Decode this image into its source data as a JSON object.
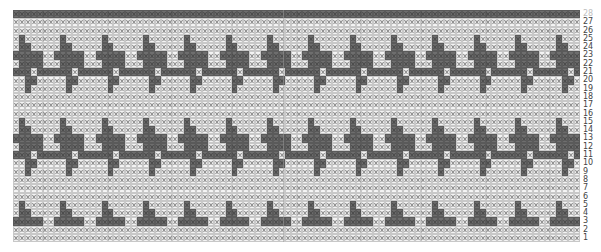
{
  "chart_title": "",
  "grid": {
    "columns": 96,
    "rows": 28,
    "cell_width_px": 5.92,
    "cell_height_px": 8.3,
    "colors": {
      "dark": "#6e6e6e",
      "light": "#f4f4f4",
      "grid": "#c8c8c8",
      "symbol": "#8a8a8a"
    },
    "cell_symbol": "x-cross",
    "top_row": "dark"
  },
  "motif": {
    "repeat_columns": 7,
    "repeat_rows": 10,
    "row_offset": 2,
    "pattern_top_to_bottom": [
      "0100000",
      "0110000",
      "1111100",
      "0111100",
      "1110111",
      "0011000",
      "0010000",
      "0000000",
      "0000000",
      "0000000"
    ]
  },
  "row_labels": [
    {
      "row": 28,
      "label": "28",
      "faded": true
    },
    {
      "row": 27,
      "label": "27"
    },
    {
      "row": 26,
      "label": "26"
    },
    {
      "row": 25,
      "label": "25"
    },
    {
      "row": 24,
      "label": "24"
    },
    {
      "row": 23,
      "label": "23"
    },
    {
      "row": 22,
      "label": "22"
    },
    {
      "row": 21,
      "label": "21"
    },
    {
      "row": 20,
      "label": "20"
    },
    {
      "row": 19,
      "label": "19"
    },
    {
      "row": 18,
      "label": "18"
    },
    {
      "row": 17,
      "label": "17"
    },
    {
      "row": 16,
      "label": "16"
    },
    {
      "row": 15,
      "label": "15"
    },
    {
      "row": 14,
      "label": "14"
    },
    {
      "row": 13,
      "label": "13"
    },
    {
      "row": 12,
      "label": "12"
    },
    {
      "row": 11,
      "label": "11"
    },
    {
      "row": 10,
      "label": "10"
    },
    {
      "row": 9,
      "label": "9"
    },
    {
      "row": 8,
      "label": "8"
    },
    {
      "row": 7,
      "label": "7"
    },
    {
      "row": 6,
      "label": "6"
    },
    {
      "row": 5,
      "label": "5"
    },
    {
      "row": 4,
      "label": "4"
    },
    {
      "row": 3,
      "label": "3"
    },
    {
      "row": 2,
      "label": "2"
    },
    {
      "row": 1,
      "label": "1"
    }
  ],
  "divider_columns_px": [
    283
  ]
}
